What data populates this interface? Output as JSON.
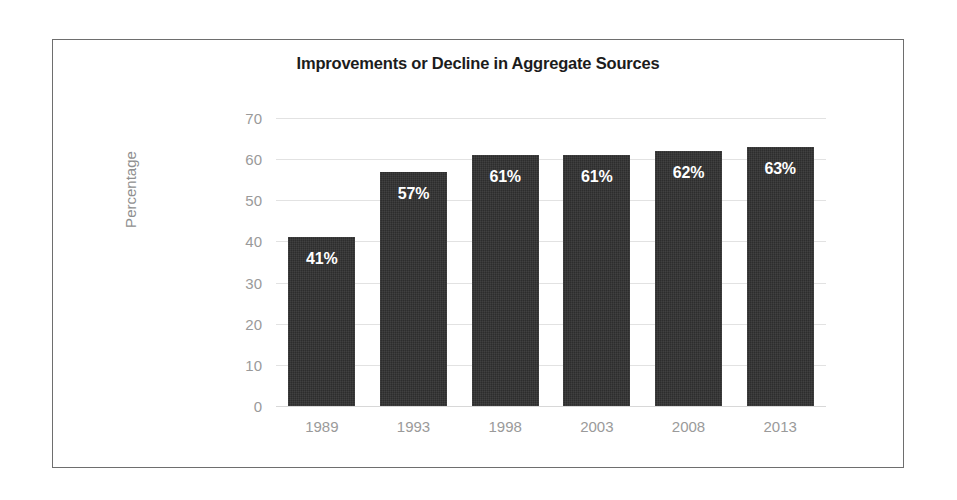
{
  "chart_data": {
    "type": "bar",
    "title": "Improvements or Decline in Aggregate Sources",
    "xlabel": "",
    "ylabel": "Percentage",
    "categories": [
      "1989",
      "1993",
      "1998",
      "2003",
      "2008",
      "2013"
    ],
    "values": [
      41,
      57,
      61,
      61,
      62,
      63
    ],
    "data_labels": [
      "41%",
      "57%",
      "61%",
      "61%",
      "62%",
      "63%"
    ],
    "ylim": [
      0,
      70
    ],
    "ytick_labels": [
      "0",
      "10",
      "20",
      "30",
      "40",
      "50",
      "60",
      "70"
    ],
    "ytick_values": [
      0,
      10,
      20,
      30,
      40,
      50,
      60,
      70
    ],
    "grid": true,
    "legend": false,
    "series": [
      {
        "name": "Percentage",
        "values": [
          41,
          57,
          61,
          61,
          62,
          63
        ]
      }
    ],
    "colors": {
      "bar": "#2d2d2d",
      "data_label": "#ffffff",
      "tick_label": "#9a9a9a",
      "axis_title": "#8f8f8f",
      "title": "#1c1c1c",
      "gridline": "#e2e2e2",
      "frame_border": "#6e6e6e",
      "background": "#ffffff"
    }
  }
}
